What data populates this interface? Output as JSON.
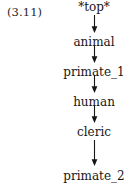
{
  "figure": {
    "equation_number": "(3.11)",
    "ink_color": "#161616",
    "background_color": "#ffffff",
    "arrow_direction": "down"
  },
  "chain": {
    "nodes": [
      {
        "label": "*top*"
      },
      {
        "label": "animal"
      },
      {
        "label": "primate_1"
      },
      {
        "label": "human"
      },
      {
        "label": "cleric"
      },
      {
        "label": "primate_2"
      }
    ],
    "arrows": [
      {
        "from": "*top*",
        "to": "animal"
      },
      {
        "from": "animal",
        "to": "primate_1"
      },
      {
        "from": "primate_1",
        "to": "human"
      },
      {
        "from": "human",
        "to": "cleric"
      },
      {
        "from": "cleric",
        "to": "primate_2"
      }
    ]
  }
}
